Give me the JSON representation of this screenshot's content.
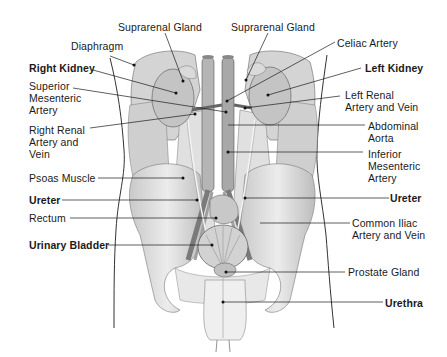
{
  "diagram": {
    "labels": {
      "suprarenal_gland_right": {
        "text": "Suprarenal Gland",
        "bold": false
      },
      "suprarenal_gland_left": {
        "text": "Suprarenal Gland",
        "bold": false
      },
      "diaphragm": {
        "text": "Diaphragm",
        "bold": false
      },
      "celiac_artery": {
        "text": "Celiac Artery",
        "bold": false
      },
      "right_kidney": {
        "text": "Right Kidney",
        "bold": true
      },
      "left_kidney": {
        "text": "Left Kidney",
        "bold": true
      },
      "superior_mesenteric_artery": {
        "text": "Superior\nMesenteric\nArtery",
        "bold": false
      },
      "left_renal_artery_vein": {
        "text": "Left Renal\nArtery and Vein",
        "bold": false
      },
      "right_renal_artery_vein": {
        "text": "Right Renal\nArtery and\nVein",
        "bold": false
      },
      "abdominal_aorta": {
        "text": "Abdominal\nAorta",
        "bold": false
      },
      "inferior_mesenteric_artery": {
        "text": "Inferior\nMesenteric\nArtery",
        "bold": false
      },
      "psoas_muscle": {
        "text": "Psoas Muscle",
        "bold": false
      },
      "ureter_left_side": {
        "text": "Ureter",
        "bold": true
      },
      "ureter_right_side": {
        "text": "Ureter",
        "bold": true
      },
      "rectum": {
        "text": "Rectum",
        "bold": false
      },
      "common_iliac": {
        "text": "Common Iliac\nArtery and Vein",
        "bold": false
      },
      "urinary_bladder": {
        "text": "Urinary Bladder",
        "bold": true
      },
      "prostate_gland": {
        "text": "Prostate Gland",
        "bold": false
      },
      "urethra": {
        "text": "Urethra",
        "bold": true
      }
    },
    "colors": {
      "line": "#1a1a1a",
      "tissue_fill": "#d9d9d9",
      "tissue_light": "#ececec",
      "tissue_dark": "#9a9a9a"
    }
  }
}
